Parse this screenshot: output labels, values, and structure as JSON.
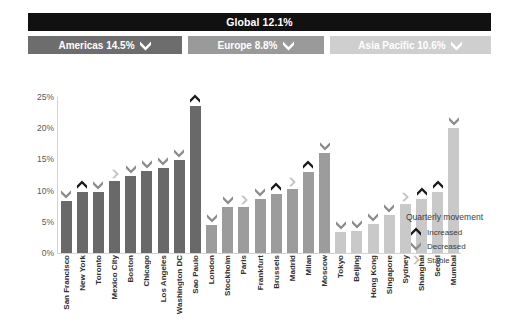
{
  "header": {
    "global": {
      "label": "Global 12.1%"
    },
    "regions": [
      {
        "key": "americas",
        "label": "Americas 14.5%",
        "marker": "decreased",
        "color": "#6d6d6d"
      },
      {
        "key": "europe",
        "label": "Europe  8.8%",
        "marker": "decreased",
        "color": "#9a9a9a"
      },
      {
        "key": "asia",
        "label": "Asia Pacific  10.6%",
        "marker": "decreased",
        "color": "#cfcfcf"
      }
    ]
  },
  "legend": {
    "title": "Quarterly movement",
    "items": [
      {
        "label": "Increased",
        "marker": "increased"
      },
      {
        "label": "Decreased",
        "marker": "decreased"
      },
      {
        "label": "Stable",
        "marker": "stable"
      }
    ]
  },
  "markers": {
    "increased": {
      "name": "chevron-up-icon",
      "color": "#1a1a1a"
    },
    "decreased": {
      "name": "chevron-down-icon",
      "color": "#8c8c8c"
    },
    "stable": {
      "name": "chevron-right-icon",
      "color": "#c4c4c4"
    }
  },
  "chart_data": {
    "type": "bar",
    "title": "",
    "xlabel": "",
    "ylabel": "",
    "ylim": [
      0,
      25
    ],
    "ytick_labels": [
      "0%",
      "5%",
      "10%",
      "15%",
      "20%",
      "25%"
    ],
    "ytick_values": [
      0,
      5,
      10,
      15,
      20,
      25
    ],
    "grid": false,
    "legend_position": "bottom-right",
    "categories": [
      "San Francisco",
      "New York",
      "Toronto",
      "Mexico City",
      "Boston",
      "Chicago",
      "Los Angeles",
      "Washington DC",
      "Sao Paulo",
      "London",
      "Stockholm",
      "Paris",
      "Frankfurt",
      "Brussels",
      "Madrid",
      "Milan",
      "Moscow",
      "Tokyo",
      "Beijing",
      "Hong Kong",
      "Singapore",
      "Sydney",
      "Shanghai",
      "Seoul",
      "Mumbai"
    ],
    "values": [
      8.3,
      9.8,
      9.8,
      11.6,
      12.3,
      13.1,
      13.6,
      14.9,
      23.5,
      4.5,
      7.3,
      7.4,
      8.7,
      9.5,
      10.2,
      13.0,
      16.0,
      3.3,
      3.6,
      4.6,
      6.1,
      7.9,
      8.7,
      9.7,
      20.1
    ],
    "regions": [
      "americas",
      "americas",
      "americas",
      "americas",
      "americas",
      "americas",
      "americas",
      "americas",
      "americas",
      "europe",
      "europe",
      "europe",
      "europe",
      "europe",
      "europe",
      "europe",
      "europe",
      "asia",
      "asia",
      "asia",
      "asia",
      "asia",
      "asia",
      "asia",
      "asia"
    ],
    "markers": [
      "decreased",
      "increased",
      "decreased",
      "stable",
      "decreased",
      "decreased",
      "decreased",
      "decreased",
      "increased",
      "decreased",
      "decreased",
      "stable",
      "decreased",
      "increased",
      "stable",
      "increased",
      "decreased",
      "decreased",
      "decreased",
      "decreased",
      "decreased",
      "stable",
      "increased",
      "increased",
      "decreased"
    ],
    "series": [
      {
        "name": "Americas",
        "color": "#696969"
      },
      {
        "name": "Europe",
        "color": "#9c9c9c"
      },
      {
        "name": "Asia Pacific",
        "color": "#c9c9c9"
      }
    ]
  }
}
